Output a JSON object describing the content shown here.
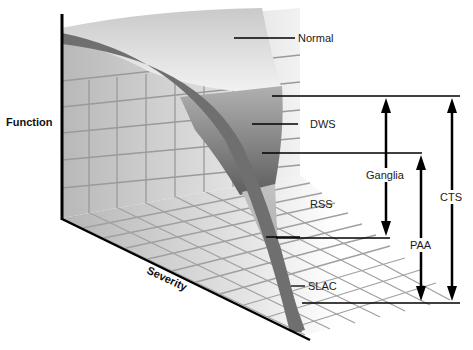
{
  "axes": {
    "y_label": "Function",
    "x_label": "Severity"
  },
  "zones": [
    {
      "label": "Normal",
      "shade": "#e6e6e6"
    },
    {
      "label": "DWS",
      "shade": "#8a8a8a"
    },
    {
      "label": "RSS",
      "shade": "#bdbdbd"
    },
    {
      "label": "SLAC",
      "shade": "#7e7e7e"
    }
  ],
  "ranges": [
    {
      "label": "Ganglia",
      "from": "DWS upper boundary",
      "to": "RSS lower boundary",
      "direction": "both"
    },
    {
      "label": "PAA",
      "from": "DWS lower boundary",
      "to": "SLAC lower boundary",
      "direction": "both"
    },
    {
      "label": "CTS",
      "from": "DWS upper boundary",
      "to": "SLAC lower boundary",
      "direction": "both"
    }
  ],
  "colors": {
    "curve_band": "#6f6f6f",
    "grid_line": "#9a9a9a",
    "axis_line": "#000000",
    "leader_line": "#000000"
  }
}
